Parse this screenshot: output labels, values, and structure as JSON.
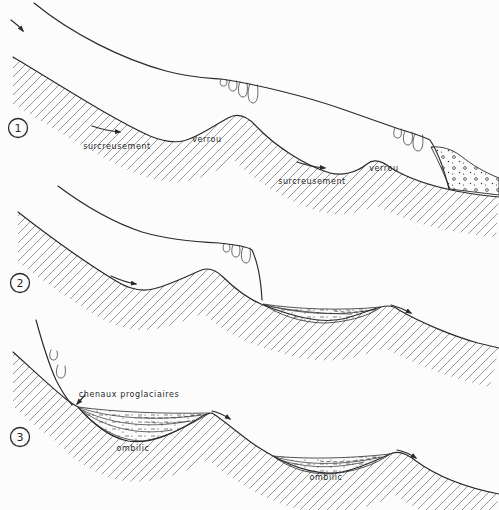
{
  "colors": {
    "background": "#fcfcfc",
    "ink": "#2a2a2a",
    "hatch": "#8f8f8f"
  },
  "stage1": {
    "number": "1",
    "surcreusement_left": "surcreusement",
    "verrou_left": "verrou",
    "surcreusement_right": "surcreusement",
    "verrou_right": "verrou"
  },
  "stage2": {
    "number": "2"
  },
  "stage3": {
    "number": "3",
    "chenaux": "chenaux proglaciaires",
    "ombilic_left": "ombilic",
    "ombilic_right": "ombilic"
  }
}
